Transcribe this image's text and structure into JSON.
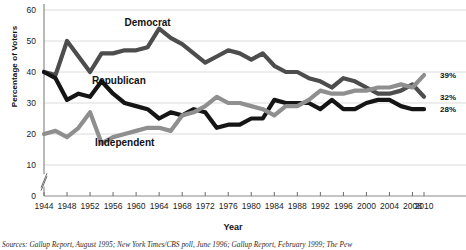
{
  "chart_data": {
    "type": "line",
    "title": "",
    "xlabel": "Year",
    "ylabel": "Percentage of Voters",
    "xlim": [
      1944,
      2010
    ],
    "ylim": [
      0,
      60
    ],
    "y_ticks": [
      0,
      10,
      20,
      30,
      40,
      50,
      60
    ],
    "x_ticks": [
      1944,
      1948,
      1952,
      1956,
      1960,
      1964,
      1968,
      1972,
      1976,
      1980,
      1984,
      1988,
      1992,
      1996,
      2000,
      2004,
      2008,
      2010
    ],
    "grid": "horizontal",
    "axis_break": true,
    "legend_position": "inline-annotations",
    "series": [
      {
        "name": "Democrat",
        "color": "#4d4d4d",
        "end_label": "32%",
        "label_position": {
          "x": 1962,
          "y": 55
        },
        "x": [
          1944,
          1946,
          1948,
          1950,
          1952,
          1954,
          1956,
          1958,
          1960,
          1962,
          1964,
          1966,
          1968,
          1970,
          1972,
          1974,
          1976,
          1978,
          1980,
          1982,
          1984,
          1986,
          1988,
          1990,
          1992,
          1994,
          1996,
          1998,
          2000,
          2002,
          2004,
          2006,
          2008,
          2010
        ],
        "y": [
          40,
          39,
          50,
          45,
          40,
          46,
          46,
          47,
          47,
          48,
          54,
          51,
          49,
          46,
          43,
          45,
          47,
          46,
          44,
          46,
          42,
          40,
          40,
          38,
          37,
          35,
          38,
          37,
          35,
          33,
          33,
          34,
          36,
          32
        ]
      },
      {
        "name": "Republican",
        "color": "#151515",
        "end_label": "28%",
        "label_position": {
          "x": 1957,
          "y": 36
        },
        "x": [
          1944,
          1946,
          1948,
          1950,
          1952,
          1954,
          1956,
          1958,
          1960,
          1962,
          1964,
          1966,
          1968,
          1970,
          1972,
          1974,
          1976,
          1978,
          1980,
          1982,
          1984,
          1986,
          1988,
          1990,
          1992,
          1994,
          1996,
          1998,
          2000,
          2002,
          2004,
          2006,
          2008,
          2010
        ],
        "y": [
          40,
          38,
          31,
          33,
          32,
          37,
          33,
          30,
          29,
          28,
          25,
          27,
          26,
          28,
          27,
          22,
          23,
          23,
          25,
          25,
          31,
          30,
          30,
          30,
          28,
          31,
          28,
          28,
          30,
          31,
          31,
          29,
          28,
          28
        ]
      },
      {
        "name": "Independent",
        "color": "#8f8f8f",
        "end_label": "39%",
        "label_position": {
          "x": 1958,
          "y": 16
        },
        "x": [
          1944,
          1946,
          1948,
          1950,
          1952,
          1954,
          1956,
          1958,
          1960,
          1962,
          1964,
          1966,
          1968,
          1970,
          1972,
          1974,
          1976,
          1978,
          1980,
          1982,
          1984,
          1986,
          1988,
          1990,
          1992,
          1994,
          1996,
          1998,
          2000,
          2002,
          2004,
          2006,
          2008,
          2010
        ],
        "y": [
          20,
          21,
          19,
          22,
          27,
          17,
          19,
          20,
          21,
          22,
          22,
          21,
          26,
          27,
          29,
          32,
          30,
          30,
          29,
          28,
          26,
          29,
          29,
          31,
          34,
          33,
          33,
          34,
          34,
          35,
          35,
          36,
          35,
          39
        ]
      }
    ]
  },
  "annotations": {
    "democrat_label": "Democrat",
    "republican_label": "Republican",
    "independent_label": "Independent"
  },
  "axes": {
    "x_title": "Year",
    "y_title": "Percentage of Voters"
  },
  "sources": {
    "prefix": "Sources:",
    "text": "Gallup Report, August 1995; New York Times/CBS poll, June 1996; Gallup Report, February 1999; The Pew"
  }
}
